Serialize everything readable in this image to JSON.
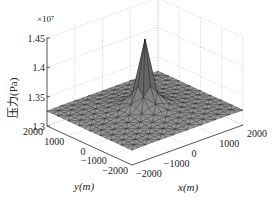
{
  "chart_data": {
    "type": "surface3d",
    "title": "",
    "xlabel": "x(m)",
    "ylabel": "y(m)",
    "zlabel": "压力(Pa)",
    "z_multiplier": "×10⁷",
    "x_ticks": [
      "-2000",
      "-1000",
      "0",
      "1000",
      "2000"
    ],
    "y_ticks": [
      "-2000",
      "-1000",
      "0",
      "1000",
      "2000"
    ],
    "z_ticks": [
      "1.3",
      "1.35",
      "1.4",
      "1.45"
    ],
    "xlim": [
      -2000,
      2000
    ],
    "ylim": [
      -2000,
      2000
    ],
    "zlim": [
      1.3,
      1.45
    ],
    "grid": true,
    "surface": {
      "description": "Triangulated pressure surface with sharp central peak",
      "base_value": 1.33,
      "corner_value": 1.325,
      "peak_value": 1.445,
      "peak_location": [
        0,
        0
      ],
      "face_color": "#8c8c8c",
      "edge_color": "#1a1a1a"
    }
  },
  "labels": {
    "multiplier": "×10⁷",
    "zlabel": "压力(Pa)",
    "xlabel": "x(m)",
    "ylabel": "y(m)"
  }
}
